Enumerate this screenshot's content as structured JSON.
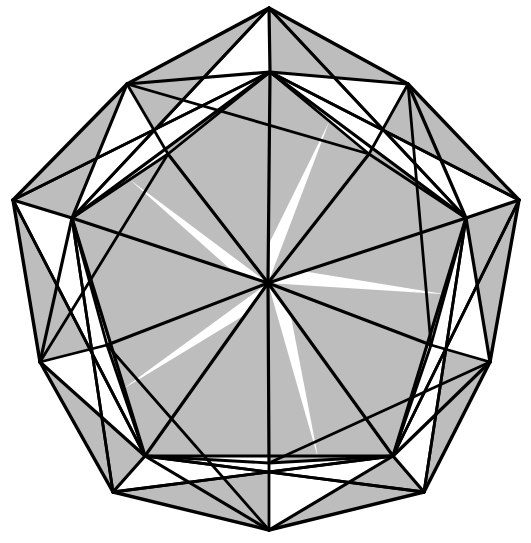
{
  "figure": {
    "symmetry_order": 5,
    "canvas": {
      "width": 531,
      "height": 543
    },
    "center": {
      "x": 268,
      "y": 283
    },
    "colors": {
      "background": "#ffffff",
      "face_shaded": "#bdbdbd",
      "face_white": "#ffffff",
      "edge": "#000000"
    },
    "stroke_widths": {
      "outer_edge": 3.4,
      "major_edge": 3.2,
      "minor_edge": 2.8
    }
  },
  "chart_data": {
    "type": "diagram",
    "xlabel": "",
    "ylabel": "",
    "vertex_groups": [
      {
        "name": "outer-apex-ring",
        "count": 5,
        "note": "Outermost pentagon tips of the star silhouette",
        "points": [
          {
            "id": "A0",
            "x": 269,
            "y": 8,
            "angle_deg": 90
          },
          {
            "id": "A1",
            "x": 519,
            "y": 200,
            "angle_deg": 18
          },
          {
            "id": "A2",
            "x": 424,
            "y": 492,
            "angle_deg": -54
          },
          {
            "id": "A3",
            "x": 113,
            "y": 492,
            "angle_deg": -126
          },
          {
            "id": "A4",
            "x": 13,
            "y": 200,
            "angle_deg": 162
          }
        ]
      },
      {
        "name": "outer-shoulder-ring",
        "count": 5,
        "note": "Secondary outer vertices between the apexes",
        "points": [
          {
            "id": "B0",
            "x": 408,
            "y": 84,
            "angle_deg": 54
          },
          {
            "id": "B1",
            "x": 490,
            "y": 362,
            "angle_deg": -18
          },
          {
            "id": "B2",
            "x": 269,
            "y": 530,
            "angle_deg": -90
          },
          {
            "id": "B3",
            "x": 40,
            "y": 362,
            "angle_deg": -162
          },
          {
            "id": "B4",
            "x": 127,
            "y": 84,
            "angle_deg": 126
          }
        ]
      },
      {
        "name": "hub-ring",
        "count": 5,
        "note": "Inner pentagon hub vertices where many edges converge",
        "points": [
          {
            "id": "H0",
            "x": 270,
            "y": 72,
            "angle_deg": 90
          },
          {
            "id": "H1",
            "x": 466,
            "y": 218,
            "angle_deg": 18
          },
          {
            "id": "H2",
            "x": 393,
            "y": 456,
            "angle_deg": -54
          },
          {
            "id": "H3",
            "x": 145,
            "y": 456,
            "angle_deg": -126
          },
          {
            "id": "H4",
            "x": 72,
            "y": 218,
            "angle_deg": 162
          }
        ]
      },
      {
        "name": "center",
        "count": 1,
        "note": "Central convergence point with ten radiating edges",
        "points": [
          {
            "id": "C",
            "x": 268,
            "y": 283,
            "angle_deg": 0
          }
        ]
      },
      {
        "name": "mid-ring",
        "count": 5,
        "note": "Midpoints between hub vertices used as facet corners",
        "points": [
          {
            "id": "M0",
            "x": 369,
            "y": 154,
            "angle_deg": 54
          },
          {
            "id": "M1",
            "x": 431,
            "y": 345,
            "angle_deg": -18
          },
          {
            "id": "M2",
            "x": 269,
            "y": 463,
            "angle_deg": -90
          },
          {
            "id": "M3",
            "x": 107,
            "y": 345,
            "angle_deg": -162
          },
          {
            "id": "M4",
            "x": 168,
            "y": 154,
            "angle_deg": 126
          }
        ]
      }
    ],
    "radii": {
      "outer_apex": 276,
      "outer_shoulder": 253,
      "hub": 212,
      "mid": 148
    },
    "face_counts": {
      "shaded": 30,
      "white": 20
    },
    "legend": [],
    "grid": false
  },
  "annotations": {
    "labels": []
  }
}
